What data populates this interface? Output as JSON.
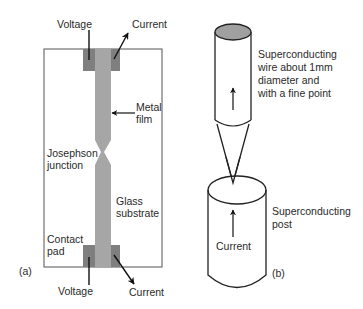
{
  "panel_a": {
    "id_label": "(a)",
    "labels": {
      "voltage_top": "Voltage",
      "current_top": "Current",
      "metal_film_1": "Metal",
      "metal_film_2": "film",
      "josephson_1": "Josephson",
      "josephson_2": "junction",
      "glass_1": "Glass",
      "glass_2": "substrate",
      "contact_1": "Contact",
      "contact_2": "pad",
      "voltage_bottom": "Voltage",
      "current_bottom": "Current"
    },
    "colors": {
      "substrate_fill": "#ffffff",
      "substrate_stroke": "#555555",
      "pad_fill": "#7f7f7f",
      "film_fill": "#a6a6a6"
    }
  },
  "panel_b": {
    "id_label": "(b)",
    "labels": {
      "wire_1": "Superconducting",
      "wire_2": "wire about 1mm",
      "wire_3": "diameter and",
      "wire_4": "with a fine point",
      "post_1": "Superconducting",
      "post_2": "post",
      "current": "Current"
    },
    "colors": {
      "wire_top_fill": "#a0a0a0",
      "outline": "#222222"
    }
  }
}
